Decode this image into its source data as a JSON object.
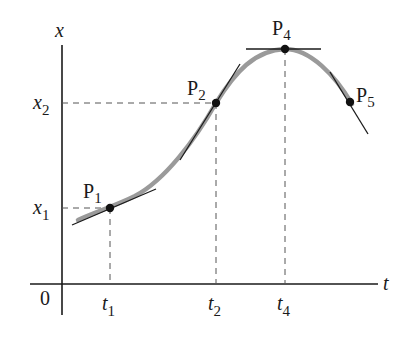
{
  "diagram": {
    "axes": {
      "x_axis_label": "t",
      "y_axis_label": "x",
      "origin_label": "0"
    },
    "y_ticks": [
      {
        "base": "x",
        "sub": "1"
      },
      {
        "base": "x",
        "sub": "2"
      }
    ],
    "t_ticks": [
      {
        "base": "t",
        "sub": "1"
      },
      {
        "base": "t",
        "sub": "2"
      },
      {
        "base": "t",
        "sub": "4"
      }
    ],
    "points": [
      {
        "base": "P",
        "sub": "1"
      },
      {
        "base": "P",
        "sub": "2"
      },
      {
        "base": "P",
        "sub": "4"
      },
      {
        "base": "P",
        "sub": "5"
      }
    ],
    "colors": {
      "curve": "#9a9a9a",
      "tangent": "#1a1a1a",
      "axis": "#1a1a1a",
      "guide": "#555555"
    }
  }
}
